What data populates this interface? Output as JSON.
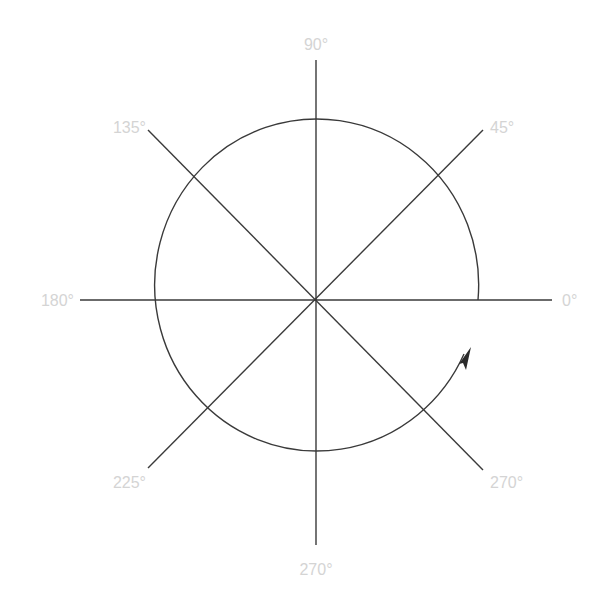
{
  "diagram": {
    "center": {
      "x": 316,
      "y": 300
    },
    "radius": 164,
    "line_color": "#3a3a3a",
    "label_color": "#d4d4d4",
    "angle_labels": [
      {
        "angle": 0,
        "text": "0°"
      },
      {
        "angle": 45,
        "text": "45°"
      },
      {
        "angle": 90,
        "text": "90°"
      },
      {
        "angle": 135,
        "text": "135°"
      },
      {
        "angle": 180,
        "text": "180°"
      },
      {
        "angle": 225,
        "text": "225°"
      },
      {
        "angle": 270,
        "text": "270°"
      },
      {
        "angle": 315,
        "text": "315°"
      }
    ],
    "arc": {
      "start_angle": 0,
      "end_angle": 342,
      "direction": "counterclockwise",
      "arrowhead": true
    }
  }
}
